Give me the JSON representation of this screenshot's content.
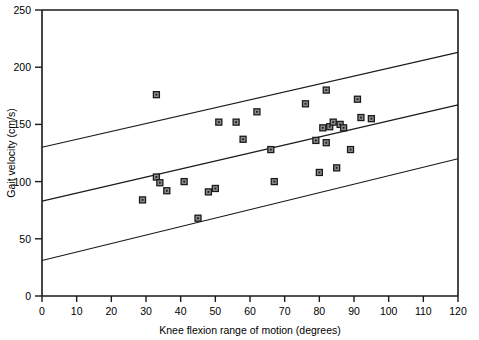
{
  "chart_data": {
    "type": "scatter",
    "title": "",
    "xlabel": "Knee flexion range of motion (degrees)",
    "ylabel": "Gait velocity (cm/s)",
    "xlim": [
      0,
      120
    ],
    "ylim": [
      0,
      250
    ],
    "xticks": [
      0,
      10,
      20,
      30,
      40,
      50,
      60,
      70,
      80,
      90,
      100,
      110,
      120
    ],
    "yticks": [
      0,
      50,
      100,
      150,
      200,
      250
    ],
    "grid": false,
    "legend": null,
    "marker": {
      "shape": "square",
      "fill": "#8c8c8c",
      "edge": "#1a1a1a",
      "size": 6
    },
    "points": [
      {
        "x": 29,
        "y": 84
      },
      {
        "x": 33,
        "y": 176
      },
      {
        "x": 33,
        "y": 104
      },
      {
        "x": 34,
        "y": 99
      },
      {
        "x": 36,
        "y": 92
      },
      {
        "x": 41,
        "y": 100
      },
      {
        "x": 45,
        "y": 68
      },
      {
        "x": 48,
        "y": 91
      },
      {
        "x": 50,
        "y": 94
      },
      {
        "x": 51,
        "y": 152
      },
      {
        "x": 56,
        "y": 152
      },
      {
        "x": 58,
        "y": 137
      },
      {
        "x": 62,
        "y": 161
      },
      {
        "x": 66,
        "y": 128
      },
      {
        "x": 67,
        "y": 100
      },
      {
        "x": 76,
        "y": 168
      },
      {
        "x": 79,
        "y": 136
      },
      {
        "x": 80,
        "y": 108
      },
      {
        "x": 81,
        "y": 147
      },
      {
        "x": 82,
        "y": 180
      },
      {
        "x": 82,
        "y": 134
      },
      {
        "x": 83,
        "y": 148
      },
      {
        "x": 84,
        "y": 152
      },
      {
        "x": 85,
        "y": 112
      },
      {
        "x": 86,
        "y": 150
      },
      {
        "x": 87,
        "y": 147
      },
      {
        "x": 89,
        "y": 128
      },
      {
        "x": 91,
        "y": 172
      },
      {
        "x": 92,
        "y": 156
      },
      {
        "x": 95,
        "y": 155
      }
    ],
    "lines": [
      {
        "name": "upper-confidence-band",
        "x0": 0,
        "y0": 130,
        "x1": 120,
        "y1": 213,
        "color": "#1a1a1a"
      },
      {
        "name": "regression-line",
        "x0": 0,
        "y0": 83,
        "x1": 120,
        "y1": 167,
        "color": "#1a1a1a"
      },
      {
        "name": "lower-confidence-band",
        "x0": 0,
        "y0": 31,
        "x1": 120,
        "y1": 120,
        "color": "#1a1a1a"
      }
    ]
  }
}
